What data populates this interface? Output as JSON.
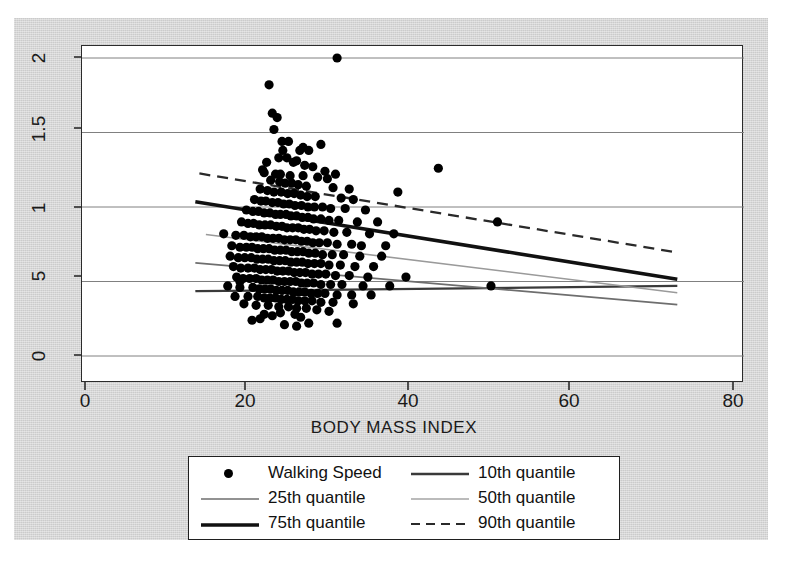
{
  "chart_data": {
    "type": "scatter",
    "title": "",
    "xlabel": "BODY MASS INDEX",
    "ylabel": "",
    "xlim": [
      0,
      80
    ],
    "ylim": [
      0,
      2
    ],
    "xticks": [
      "0",
      "20",
      "40",
      "60",
      "80"
    ],
    "xtick_values": [
      0,
      20,
      40,
      60,
      80
    ],
    "yticks": [
      "0",
      "5",
      "1",
      "1.5",
      "2"
    ],
    "ytick_values": [
      0,
      0.5,
      1,
      1.5,
      2
    ],
    "grid": "horizontal",
    "legend_position": "below-axes",
    "series": [
      {
        "name": "Walking Speed",
        "type": "scatter",
        "marker": "filled-circle",
        "color": "#000000",
        "points": [
          [
            31.0,
            2.0
          ],
          [
            22.6,
            1.82
          ],
          [
            23.0,
            1.63
          ],
          [
            23.6,
            1.6
          ],
          [
            23.2,
            1.52
          ],
          [
            25.0,
            1.44
          ],
          [
            29.0,
            1.42
          ],
          [
            43.5,
            1.26
          ],
          [
            38.5,
            1.1
          ],
          [
            24.3,
            1.38
          ],
          [
            26.4,
            1.38
          ],
          [
            27.5,
            1.38
          ],
          [
            23.8,
            1.33
          ],
          [
            24.8,
            1.33
          ],
          [
            26.0,
            1.31
          ],
          [
            22.3,
            1.3
          ],
          [
            25.6,
            1.3
          ],
          [
            27.0,
            1.28
          ],
          [
            28.0,
            1.27
          ],
          [
            21.8,
            1.25
          ],
          [
            22.0,
            1.23
          ],
          [
            23.4,
            1.22
          ],
          [
            24.0,
            1.22
          ],
          [
            25.2,
            1.21
          ],
          [
            26.8,
            1.21
          ],
          [
            28.6,
            1.2
          ],
          [
            29.8,
            1.19
          ],
          [
            22.8,
            1.18
          ],
          [
            23.9,
            1.17
          ],
          [
            24.6,
            1.16
          ],
          [
            25.4,
            1.16
          ],
          [
            26.2,
            1.15
          ],
          [
            27.2,
            1.14
          ],
          [
            30.5,
            1.13
          ],
          [
            21.5,
            1.12
          ],
          [
            22.4,
            1.11
          ],
          [
            23.2,
            1.1
          ],
          [
            24.1,
            1.1
          ],
          [
            24.9,
            1.09
          ],
          [
            25.7,
            1.09
          ],
          [
            26.5,
            1.08
          ],
          [
            27.3,
            1.07
          ],
          [
            28.3,
            1.07
          ],
          [
            31.5,
            1.06
          ],
          [
            33.0,
            1.05
          ],
          [
            20.8,
            1.05
          ],
          [
            21.6,
            1.04
          ],
          [
            22.2,
            1.04
          ],
          [
            23.0,
            1.03
          ],
          [
            23.7,
            1.03
          ],
          [
            24.4,
            1.02
          ],
          [
            25.1,
            1.02
          ],
          [
            25.8,
            1.01
          ],
          [
            26.6,
            1.01
          ],
          [
            27.4,
            1.0
          ],
          [
            28.2,
            1.0
          ],
          [
            29.2,
            1.0
          ],
          [
            30.2,
            0.99
          ],
          [
            32.0,
            0.99
          ],
          [
            34.5,
            0.98
          ],
          [
            19.8,
            0.98
          ],
          [
            20.6,
            0.97
          ],
          [
            21.3,
            0.97
          ],
          [
            22.0,
            0.96
          ],
          [
            22.7,
            0.96
          ],
          [
            23.4,
            0.95
          ],
          [
            24.0,
            0.95
          ],
          [
            24.7,
            0.95
          ],
          [
            25.3,
            0.94
          ],
          [
            26.0,
            0.94
          ],
          [
            26.7,
            0.93
          ],
          [
            27.4,
            0.93
          ],
          [
            28.1,
            0.92
          ],
          [
            29.0,
            0.92
          ],
          [
            30.0,
            0.91
          ],
          [
            31.2,
            0.91
          ],
          [
            33.5,
            0.9
          ],
          [
            36.0,
            0.9
          ],
          [
            50.8,
            0.9
          ],
          [
            19.2,
            0.9
          ],
          [
            20.0,
            0.89
          ],
          [
            20.7,
            0.89
          ],
          [
            21.4,
            0.88
          ],
          [
            22.1,
            0.88
          ],
          [
            22.8,
            0.88
          ],
          [
            23.5,
            0.87
          ],
          [
            24.2,
            0.87
          ],
          [
            24.8,
            0.86
          ],
          [
            25.5,
            0.86
          ],
          [
            26.2,
            0.86
          ],
          [
            26.9,
            0.85
          ],
          [
            27.6,
            0.85
          ],
          [
            28.4,
            0.84
          ],
          [
            29.4,
            0.84
          ],
          [
            30.6,
            0.83
          ],
          [
            32.2,
            0.83
          ],
          [
            35.0,
            0.82
          ],
          [
            38.0,
            0.82
          ],
          [
            17.0,
            0.82
          ],
          [
            18.5,
            0.81
          ],
          [
            19.5,
            0.81
          ],
          [
            20.3,
            0.8
          ],
          [
            21.0,
            0.8
          ],
          [
            21.7,
            0.8
          ],
          [
            22.4,
            0.79
          ],
          [
            23.1,
            0.79
          ],
          [
            23.8,
            0.79
          ],
          [
            24.5,
            0.78
          ],
          [
            25.2,
            0.78
          ],
          [
            25.9,
            0.78
          ],
          [
            26.6,
            0.77
          ],
          [
            27.3,
            0.77
          ],
          [
            28.0,
            0.76
          ],
          [
            28.8,
            0.76
          ],
          [
            29.8,
            0.76
          ],
          [
            31.0,
            0.75
          ],
          [
            32.8,
            0.75
          ],
          [
            34.0,
            0.74
          ],
          [
            37.0,
            0.74
          ],
          [
            18.0,
            0.74
          ],
          [
            19.0,
            0.73
          ],
          [
            19.8,
            0.73
          ],
          [
            20.5,
            0.73
          ],
          [
            21.2,
            0.72
          ],
          [
            21.9,
            0.72
          ],
          [
            22.6,
            0.72
          ],
          [
            23.3,
            0.71
          ],
          [
            24.0,
            0.71
          ],
          [
            24.7,
            0.71
          ],
          [
            25.4,
            0.7
          ],
          [
            26.1,
            0.7
          ],
          [
            26.8,
            0.7
          ],
          [
            27.5,
            0.69
          ],
          [
            28.3,
            0.69
          ],
          [
            29.2,
            0.68
          ],
          [
            30.4,
            0.68
          ],
          [
            31.8,
            0.68
          ],
          [
            33.8,
            0.67
          ],
          [
            36.5,
            0.67
          ],
          [
            17.8,
            0.67
          ],
          [
            18.8,
            0.66
          ],
          [
            19.6,
            0.66
          ],
          [
            20.4,
            0.66
          ],
          [
            21.1,
            0.65
          ],
          [
            21.8,
            0.65
          ],
          [
            22.5,
            0.65
          ],
          [
            23.2,
            0.64
          ],
          [
            23.9,
            0.64
          ],
          [
            24.6,
            0.64
          ],
          [
            25.3,
            0.63
          ],
          [
            26.0,
            0.63
          ],
          [
            26.7,
            0.63
          ],
          [
            27.4,
            0.62
          ],
          [
            28.2,
            0.62
          ],
          [
            29.0,
            0.62
          ],
          [
            30.0,
            0.61
          ],
          [
            31.4,
            0.61
          ],
          [
            33.2,
            0.6
          ],
          [
            35.5,
            0.6
          ],
          [
            18.2,
            0.6
          ],
          [
            19.1,
            0.59
          ],
          [
            20.0,
            0.59
          ],
          [
            20.8,
            0.59
          ],
          [
            21.5,
            0.58
          ],
          [
            22.2,
            0.58
          ],
          [
            22.9,
            0.58
          ],
          [
            23.6,
            0.57
          ],
          [
            24.3,
            0.57
          ],
          [
            25.0,
            0.57
          ],
          [
            25.7,
            0.56
          ],
          [
            26.4,
            0.56
          ],
          [
            27.1,
            0.56
          ],
          [
            27.9,
            0.55
          ],
          [
            28.7,
            0.55
          ],
          [
            29.6,
            0.55
          ],
          [
            30.8,
            0.54
          ],
          [
            32.5,
            0.54
          ],
          [
            34.8,
            0.53
          ],
          [
            39.5,
            0.53
          ],
          [
            18.6,
            0.53
          ],
          [
            19.4,
            0.52
          ],
          [
            20.2,
            0.52
          ],
          [
            21.0,
            0.52
          ],
          [
            21.7,
            0.51
          ],
          [
            22.4,
            0.51
          ],
          [
            23.1,
            0.51
          ],
          [
            23.8,
            0.5
          ],
          [
            24.5,
            0.5
          ],
          [
            25.2,
            0.5
          ],
          [
            25.9,
            0.5
          ],
          [
            26.6,
            0.49
          ],
          [
            27.3,
            0.49
          ],
          [
            28.1,
            0.49
          ],
          [
            29.0,
            0.48
          ],
          [
            30.2,
            0.48
          ],
          [
            31.6,
            0.48
          ],
          [
            34.2,
            0.47
          ],
          [
            37.5,
            0.47
          ],
          [
            50.0,
            0.47
          ],
          [
            17.5,
            0.47
          ],
          [
            19.0,
            0.46
          ],
          [
            20.6,
            0.46
          ],
          [
            21.4,
            0.45
          ],
          [
            22.1,
            0.45
          ],
          [
            22.8,
            0.45
          ],
          [
            23.5,
            0.44
          ],
          [
            24.2,
            0.44
          ],
          [
            24.9,
            0.44
          ],
          [
            25.6,
            0.43
          ],
          [
            26.3,
            0.43
          ],
          [
            27.0,
            0.43
          ],
          [
            27.8,
            0.42
          ],
          [
            28.6,
            0.42
          ],
          [
            29.5,
            0.42
          ],
          [
            31.0,
            0.41
          ],
          [
            32.8,
            0.41
          ],
          [
            35.2,
            0.41
          ],
          [
            18.4,
            0.4
          ],
          [
            20.0,
            0.4
          ],
          [
            21.2,
            0.4
          ],
          [
            22.0,
            0.39
          ],
          [
            22.7,
            0.39
          ],
          [
            23.4,
            0.39
          ],
          [
            24.1,
            0.38
          ],
          [
            24.8,
            0.38
          ],
          [
            25.5,
            0.38
          ],
          [
            26.2,
            0.37
          ],
          [
            27.0,
            0.37
          ],
          [
            27.9,
            0.37
          ],
          [
            29.0,
            0.36
          ],
          [
            30.5,
            0.36
          ],
          [
            33.0,
            0.35
          ],
          [
            19.5,
            0.35
          ],
          [
            21.0,
            0.34
          ],
          [
            22.5,
            0.34
          ],
          [
            23.8,
            0.33
          ],
          [
            25.0,
            0.33
          ],
          [
            26.0,
            0.32
          ],
          [
            27.2,
            0.32
          ],
          [
            28.5,
            0.31
          ],
          [
            30.0,
            0.3
          ],
          [
            24.0,
            0.29
          ],
          [
            25.8,
            0.28
          ],
          [
            22.0,
            0.28
          ],
          [
            23.0,
            0.27
          ],
          [
            26.5,
            0.26
          ],
          [
            21.5,
            0.25
          ],
          [
            20.5,
            0.24
          ],
          [
            31.0,
            0.22
          ],
          [
            27.5,
            0.22
          ],
          [
            24.5,
            0.21
          ],
          [
            26.0,
            0.2
          ],
          [
            19.0,
            0.5
          ],
          [
            29.5,
            1.24
          ],
          [
            30.8,
            1.22
          ],
          [
            32.5,
            1.12
          ],
          [
            24.2,
            1.44
          ],
          [
            26.8,
            1.4
          ]
        ]
      },
      {
        "name": "10th quantile",
        "type": "line",
        "style": "solid",
        "weight": "medium",
        "color": "#3a3a3a",
        "x": [
          13.5,
          73.0
        ],
        "y": [
          0.435,
          0.47
        ]
      },
      {
        "name": "25th quantile",
        "type": "line",
        "style": "solid",
        "weight": "thin",
        "color": "#6e6e6e",
        "x": [
          13.5,
          73.0
        ],
        "y": [
          0.625,
          0.345
        ]
      },
      {
        "name": "50th quantile",
        "type": "line",
        "style": "solid",
        "weight": "thin-light",
        "color": "#9a9a9a",
        "x": [
          14.8,
          73.0
        ],
        "y": [
          0.815,
          0.425
        ]
      },
      {
        "name": "75th quantile",
        "type": "line",
        "style": "solid",
        "weight": "thick",
        "color": "#111111",
        "x": [
          13.5,
          73.0
        ],
        "y": [
          1.035,
          0.515
        ]
      },
      {
        "name": "90th quantile",
        "type": "line",
        "style": "dashed",
        "weight": "medium",
        "color": "#2a2a2a",
        "x": [
          14.0,
          73.0
        ],
        "y": [
          1.225,
          0.695
        ]
      }
    ],
    "legend": [
      {
        "label": "Walking Speed",
        "key": "dot"
      },
      {
        "label": "10th quantile",
        "key": "line-medium"
      },
      {
        "label": "25th quantile",
        "key": "line-thin"
      },
      {
        "label": "50th quantile",
        "key": "line-light"
      },
      {
        "label": "75th quantile",
        "key": "line-thick"
      },
      {
        "label": "90th quantile",
        "key": "line-dashed"
      }
    ]
  },
  "colors": {
    "page_background": "#d2d2d2",
    "plot_background": "#ffffff",
    "axis": "#2b2b2b",
    "gridline": "#808080",
    "marker": "#000000"
  }
}
